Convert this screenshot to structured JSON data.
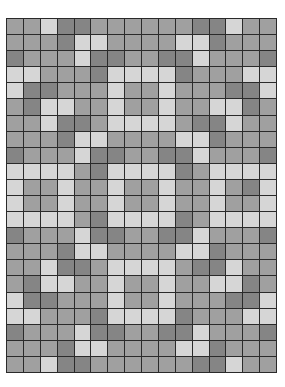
{
  "pattern": {
    "columns": 16,
    "rows": 22,
    "colors": {
      "L": "#d6d6d6",
      "M": "#a0a0a0",
      "D": "#858585",
      "line": "#2a2a2a"
    },
    "cells": [
      "MMLDDMMMMMMDDLMM",
      "MMMDLLMMMMLLDMMM",
      "DMMMLDDMMDDLMMMD",
      "LLMMMDLLLLDMMMLL",
      "LDDMMMLMMLMMMDDL",
      "MDLLMMLMMLMMLLDM",
      "MMLDDMLLLLMDDLMM",
      "MMMDLLMMMMLLDMMM",
      "DMMMLDDMMDDLMMMD",
      "LLLLMDLLLLDMLLLL",
      "LMMLMMLMMLMMLMDL",
      "LMMLMMLMMLMMLMML",
      "LLLLMDLLLLDMLLLL",
      "DMMMLDDMMDDLMMMD",
      "MMMDLLMMMMLLDMMM",
      "MMLDDMLLLLMDDLMM",
      "MDLLMMLMMLMMLLDM",
      "LDDMMMLMMLMMMDDL",
      "LLMMMDLLLLDMMMLL",
      "DMMMLDDMMDDLMMMD",
      "MMMDLLMMMMLLDMMM",
      "MMLDDMMMMMMDDLMM"
    ]
  }
}
